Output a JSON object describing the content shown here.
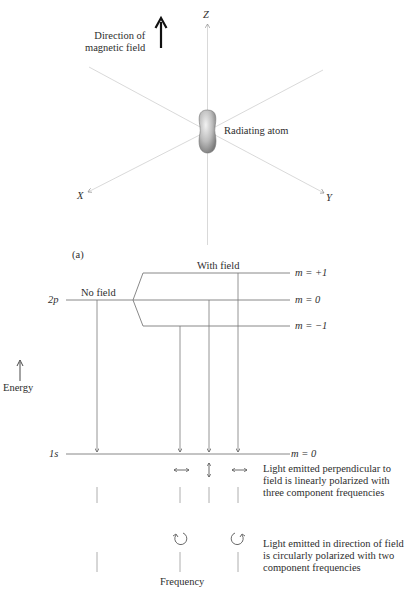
{
  "figure": {
    "panel_label": "(a)",
    "top": {
      "field_label_line1": "Direction of",
      "field_label_line2": "magnetic field",
      "axis_z": "Z",
      "axis_x": "X",
      "axis_y": "Y",
      "atom_label": "Radiating atom"
    },
    "levels": {
      "upper_state": "2p",
      "lower_state": "1s",
      "no_field_label": "No field",
      "with_field_label": "With field",
      "m_plus": "m = +1",
      "m_zero": "m = 0",
      "m_minus": "m = −1",
      "m_ground": "m = 0",
      "energy_label": "Energy"
    },
    "spectra": {
      "perpendicular_text": "Light emitted perpendicular to field is linearly polarized with three component frequencies",
      "parallel_text": "Light emitted in direction of field is circularly polarized with two component frequencies",
      "frequency_label": "Frequency"
    },
    "colors": {
      "axis_line": "#c8c8c8",
      "level_line": "#7a7a7a",
      "text": "#2e2e2e",
      "arrow": "#111111"
    }
  }
}
